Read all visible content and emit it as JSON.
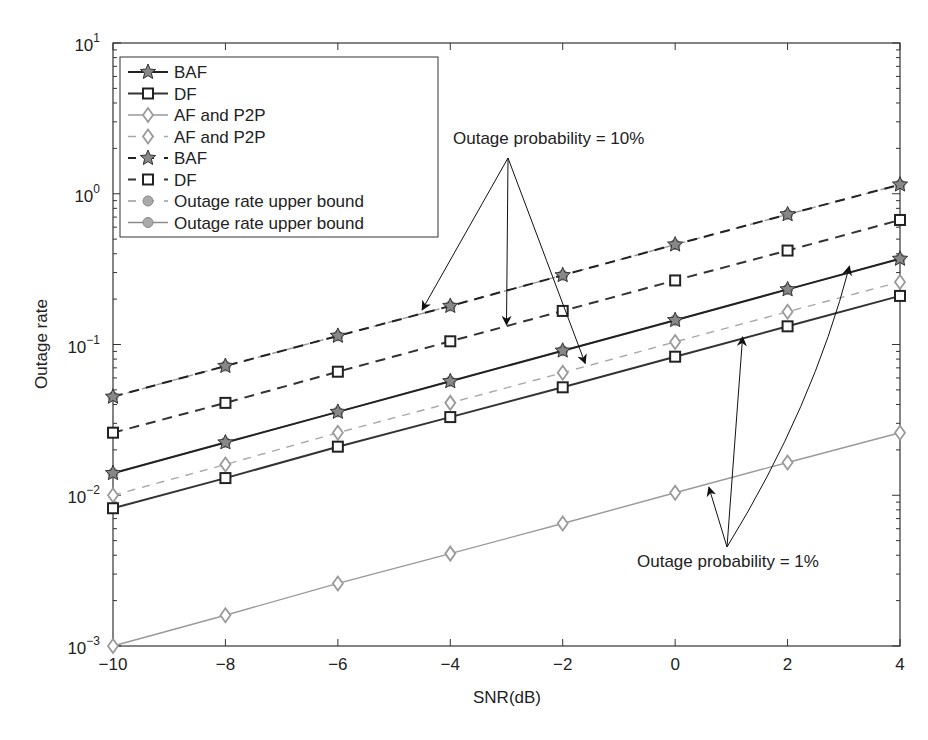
{
  "chart_data": {
    "type": "line",
    "title": "",
    "xlabel": "SNR(dB)",
    "ylabel": "Outage rate",
    "xscale": "linear",
    "yscale": "log",
    "xlim": [
      -10,
      4
    ],
    "ylim": [
      0.001,
      10
    ],
    "x": [
      -10,
      -8,
      -6,
      -4,
      -2,
      0,
      2,
      4
    ],
    "xticks": [
      -10,
      -8,
      -6,
      -4,
      -2,
      0,
      2,
      4
    ],
    "xtick_labels": [
      "−10",
      "−8",
      "−6",
      "−4",
      "−2",
      "0",
      "2",
      "4"
    ],
    "yticks": [
      {
        "base": "10",
        "exp": "1",
        "value": 10
      },
      {
        "base": "10",
        "exp": "0",
        "value": 1
      },
      {
        "base": "10",
        "exp": "−1",
        "value": 0.1
      },
      {
        "base": "10",
        "exp": "−2",
        "value": 0.01
      },
      {
        "base": "10",
        "exp": "−3",
        "value": 0.001
      }
    ],
    "grid": false,
    "legend_position": "top-left",
    "series": [
      {
        "name": "BAF",
        "style": "solid",
        "marker": "star",
        "color": "#222222",
        "values": [
          0.014,
          0.0224,
          0.0357,
          0.057,
          0.091,
          0.145,
          0.232,
          0.37
        ]
      },
      {
        "name": "DF",
        "style": "solid",
        "marker": "square",
        "color": "#333333",
        "values": [
          0.0082,
          0.013,
          0.021,
          0.033,
          0.052,
          0.083,
          0.132,
          0.21
        ]
      },
      {
        "name": "AF and P2P",
        "style": "solid",
        "marker": "diamond",
        "color": "#9a9a9a",
        "values": [
          0.001,
          0.0016,
          0.0026,
          0.0041,
          0.0065,
          0.0104,
          0.0165,
          0.026
        ]
      },
      {
        "name": "AF and P2P",
        "style": "dashed",
        "marker": "diamond",
        "color": "#a8a8a8",
        "values": [
          0.01,
          0.016,
          0.026,
          0.041,
          0.065,
          0.104,
          0.165,
          0.26
        ]
      },
      {
        "name": "BAF",
        "style": "dashed",
        "marker": "star",
        "color": "#222222",
        "values": [
          0.045,
          0.072,
          0.114,
          0.18,
          0.288,
          0.46,
          0.73,
          1.15
        ]
      },
      {
        "name": "DF",
        "style": "dashed",
        "marker": "square",
        "color": "#333333",
        "values": [
          0.026,
          0.041,
          0.066,
          0.105,
          0.167,
          0.266,
          0.42,
          0.67
        ]
      },
      {
        "name": "Outage rate upper bound",
        "style": "dashed",
        "marker": "circle",
        "color": "#999999",
        "values": [
          0.045,
          0.072,
          0.114,
          0.18,
          0.288,
          0.46,
          0.73,
          1.15
        ]
      },
      {
        "name": "Outage rate upper bound",
        "style": "solid",
        "marker": "circle",
        "color": "#8a8a8a",
        "values": [
          0.014,
          0.0224,
          0.0357,
          0.057,
          0.091,
          0.145,
          0.232,
          0.37
        ]
      }
    ],
    "annotations": [
      {
        "text": "Outage probability = 10%",
        "targets": [
          {
            "x": -4.5,
            "y": 0.17
          },
          {
            "x": -3.0,
            "y": 0.135
          },
          {
            "x": -1.6,
            "y": 0.075
          }
        ]
      },
      {
        "text": "Outage probability = 1%",
        "targets": [
          {
            "x": 0.6,
            "y": 0.0113
          },
          {
            "x": 1.2,
            "y": 0.112
          },
          {
            "x": 3.1,
            "y": 0.33
          }
        ]
      }
    ]
  }
}
